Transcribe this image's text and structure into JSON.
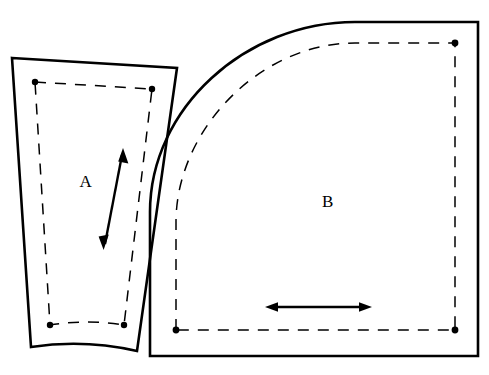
{
  "diagram": {
    "background_color": "#ffffff",
    "line_color": "#000000",
    "width": 489,
    "height": 375,
    "pieces": [
      {
        "id": "A",
        "label": "A",
        "label_x": 86,
        "label_y": 183,
        "description": "tapered quadrilateral panel with concave lower edge",
        "cutting_line_path": "M 12 58 L 177 68 L 137 351 Q 84 339 31 347 Z",
        "seam_line_path": "M 35 82 L 152 89 L 124 325 Q 87 319 50 325 Z",
        "notch_dots": [
          {
            "x": 35,
            "y": 82
          },
          {
            "x": 152,
            "y": 89
          },
          {
            "x": 124,
            "y": 325
          },
          {
            "x": 50,
            "y": 325
          }
        ],
        "grain_arrow": {
          "type": "double-headed",
          "x1": 104,
          "y1": 248,
          "x2": 123,
          "y2": 150
        }
      },
      {
        "id": "B",
        "label": "B",
        "label_x": 328,
        "label_y": 203,
        "description": "quarter-round panel with curved upper-left edge",
        "cutting_line_path": "M 150 356 L 150 212 C 150 108 246 22 355 22 L 478 22 L 478 356 Z",
        "seam_line_path": "M 176 330 L 176 222 C 176 131 259 43 355 43 L 455 43 L 455 330 Z",
        "notch_dots": [
          {
            "x": 176,
            "y": 330
          },
          {
            "x": 455,
            "y": 43
          },
          {
            "x": 455,
            "y": 330
          }
        ],
        "grain_arrow": {
          "type": "double-headed",
          "x1": 266,
          "y1": 307,
          "x2": 371,
          "y2": 307
        }
      }
    ],
    "legend": {
      "cutting_line": "solid line",
      "seam_line": "dashed line",
      "grain_line": "double-headed arrow"
    }
  }
}
